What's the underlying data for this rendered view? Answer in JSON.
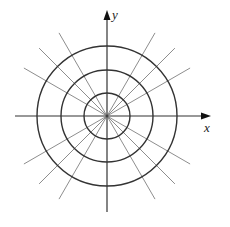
{
  "diagram": {
    "type": "polar-grid",
    "center": [
      107,
      116
    ],
    "circle_radii": [
      23,
      46,
      70
    ],
    "radial_angles_deg": [
      30,
      45,
      60,
      120,
      135,
      150,
      210,
      225,
      240,
      300,
      315,
      330
    ],
    "radial_length": 96,
    "x_axis": {
      "label": "x",
      "from": 15,
      "to": 211
    },
    "y_axis": {
      "label": "y",
      "from": 212,
      "to": 10
    },
    "colors": {
      "circles": "#333333",
      "radials": "#808080",
      "axes": "#333333",
      "background": "#ffffff"
    }
  }
}
